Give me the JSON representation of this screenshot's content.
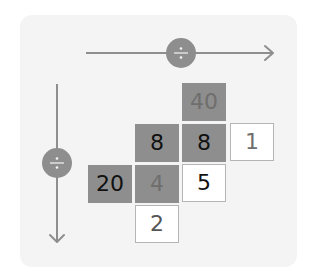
{
  "diagram": {
    "operator_symbol": "÷",
    "horizontal_arrow": {
      "direction": "right",
      "operator": "÷"
    },
    "vertical_arrow": {
      "direction": "down",
      "operator": "÷"
    },
    "cells": [
      {
        "id": "r0c2",
        "row": 0,
        "col": 2,
        "value": "40",
        "style": "shaded",
        "text_tone": "faded"
      },
      {
        "id": "r1c1",
        "row": 1,
        "col": 1,
        "value": "8",
        "style": "shaded",
        "text_tone": "dark"
      },
      {
        "id": "r1c2",
        "row": 1,
        "col": 2,
        "value": "8",
        "style": "shaded",
        "text_tone": "dark"
      },
      {
        "id": "r1c3",
        "row": 1,
        "col": 3,
        "value": "1",
        "style": "blank",
        "text_tone": "faded"
      },
      {
        "id": "r2c0",
        "row": 2,
        "col": 0,
        "value": "20",
        "style": "shaded",
        "text_tone": "dark"
      },
      {
        "id": "r2c1",
        "row": 2,
        "col": 1,
        "value": "4",
        "style": "shaded",
        "text_tone": "faded"
      },
      {
        "id": "r2c2",
        "row": 2,
        "col": 2,
        "value": "5",
        "style": "blank",
        "text_tone": "dark"
      },
      {
        "id": "r3c1",
        "row": 3,
        "col": 1,
        "value": "2",
        "style": "blank",
        "text_tone": "mid"
      }
    ],
    "colors": {
      "panel": "#f4f4f4",
      "shaded_cell": "#8e8e8e",
      "arrow": "#8e8e8e",
      "operator_circle": "#8e8e8e"
    }
  }
}
